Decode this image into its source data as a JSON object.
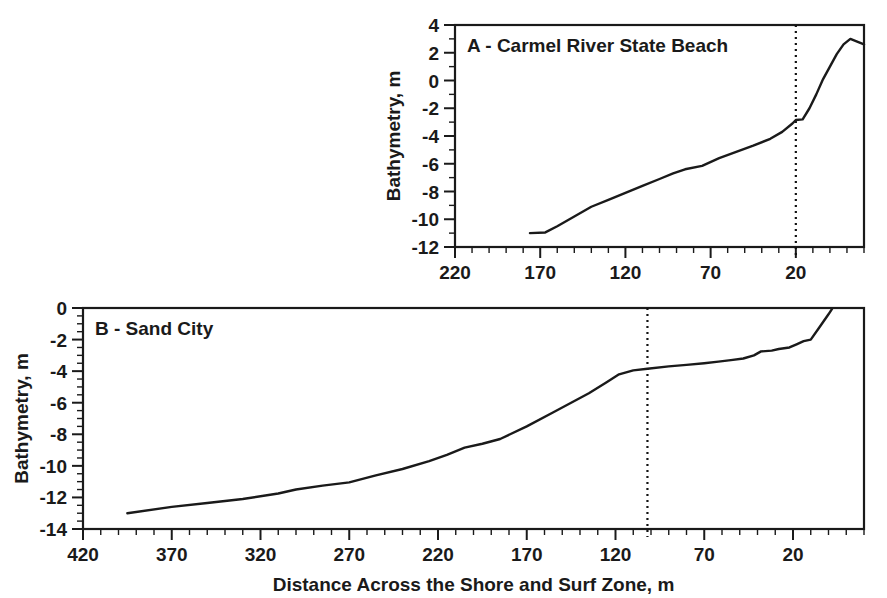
{
  "figure": {
    "background_color": "#ffffff",
    "line_color": "#1a1a1a",
    "width": 887,
    "height": 598,
    "shared_y_axis_title": "Bathymetry, m",
    "shared_x_axis_title": "Distance Across the Shore and Surf Zone, m"
  },
  "chart_data": [
    {
      "type": "line",
      "panel": "A",
      "title": "A - Carmel River State Beach",
      "xlabel": "",
      "ylabel": "Bathymetry, m",
      "xlim": [
        220,
        -20
      ],
      "ylim": [
        -12,
        4
      ],
      "x_ticks": [
        220,
        170,
        120,
        70,
        20
      ],
      "x_tick_labels": [
        "220",
        "170",
        "120",
        "70",
        "20"
      ],
      "x_minor_step": 10,
      "y_ticks": [
        4,
        2,
        0,
        -2,
        -4,
        -6,
        -8,
        -10,
        -12
      ],
      "y_tick_labels": [
        "4",
        "2",
        "0",
        "-2",
        "-4",
        "-6",
        "-8",
        "-10",
        "-12"
      ],
      "y_minor_step": 1,
      "grid": false,
      "x_axis_reversed": true,
      "annotations": [
        {
          "name": "breaker-line",
          "type": "vertical-dotted-line",
          "x": 20
        }
      ],
      "series": [
        {
          "name": "Carmel River State Beach profile",
          "x": [
            176,
            167,
            160,
            150,
            140,
            130,
            120,
            110,
            100,
            92,
            85,
            75,
            65,
            55,
            45,
            35,
            28,
            22,
            20,
            16,
            12,
            8,
            4,
            0,
            -4,
            -8,
            -12,
            -16,
            -20
          ],
          "y": [
            -11.0,
            -10.95,
            -10.5,
            -9.8,
            -9.1,
            -8.6,
            -8.1,
            -7.6,
            -7.1,
            -6.7,
            -6.4,
            -6.15,
            -5.6,
            -5.15,
            -4.7,
            -4.2,
            -3.7,
            -3.1,
            -2.85,
            -2.8,
            -2.0,
            -1.0,
            0.1,
            1.0,
            1.9,
            2.6,
            3.0,
            2.8,
            2.6
          ]
        }
      ]
    },
    {
      "type": "line",
      "panel": "B",
      "title": "B - Sand City",
      "xlabel": "Distance Across the Shore and Surf Zone, m",
      "ylabel": "Bathymetry, m",
      "xlim": [
        420,
        -20
      ],
      "ylim": [
        -14,
        0
      ],
      "x_ticks": [
        420,
        370,
        320,
        270,
        220,
        170,
        120,
        70,
        20
      ],
      "x_tick_labels": [
        "420",
        "370",
        "320",
        "270",
        "220",
        "170",
        "120",
        "70",
        "20"
      ],
      "x_minor_step": 10,
      "y_ticks": [
        0,
        -2,
        -4,
        -6,
        -8,
        -10,
        -12,
        -14
      ],
      "y_tick_labels": [
        "0",
        "-2",
        "-4",
        "-6",
        "-8",
        "-10",
        "-12",
        "-14"
      ],
      "y_minor_step": 0.5,
      "grid": false,
      "x_axis_reversed": true,
      "annotations": [
        {
          "name": "breaker-line",
          "type": "vertical-dotted-line",
          "x": 102
        }
      ],
      "series": [
        {
          "name": "Sand City profile",
          "x": [
            395,
            370,
            350,
            330,
            310,
            300,
            285,
            270,
            255,
            240,
            225,
            215,
            205,
            195,
            185,
            170,
            155,
            145,
            135,
            125,
            118,
            110,
            102,
            90,
            80,
            70,
            62,
            55,
            48,
            42,
            38,
            32,
            28,
            22,
            18,
            14,
            10,
            5,
            0,
            -2
          ],
          "y": [
            -13.0,
            -12.6,
            -12.35,
            -12.1,
            -11.75,
            -11.5,
            -11.25,
            -11.05,
            -10.6,
            -10.2,
            -9.7,
            -9.3,
            -8.85,
            -8.6,
            -8.3,
            -7.5,
            -6.6,
            -6.0,
            -5.4,
            -4.7,
            -4.2,
            -3.95,
            -3.85,
            -3.7,
            -3.6,
            -3.5,
            -3.4,
            -3.3,
            -3.2,
            -3.0,
            -2.75,
            -2.7,
            -2.6,
            -2.5,
            -2.3,
            -2.1,
            -2.0,
            -1.2,
            -0.4,
            -0.05
          ]
        }
      ]
    }
  ],
  "panels": {
    "a": {
      "label": "A - Carmel River State Beach",
      "y_axis_title": "Bathymetry, m"
    },
    "b": {
      "label": "B - Sand City",
      "y_axis_title": "Bathymetry, m",
      "x_axis_title": "Distance Across the Shore and Surf Zone, m"
    }
  }
}
